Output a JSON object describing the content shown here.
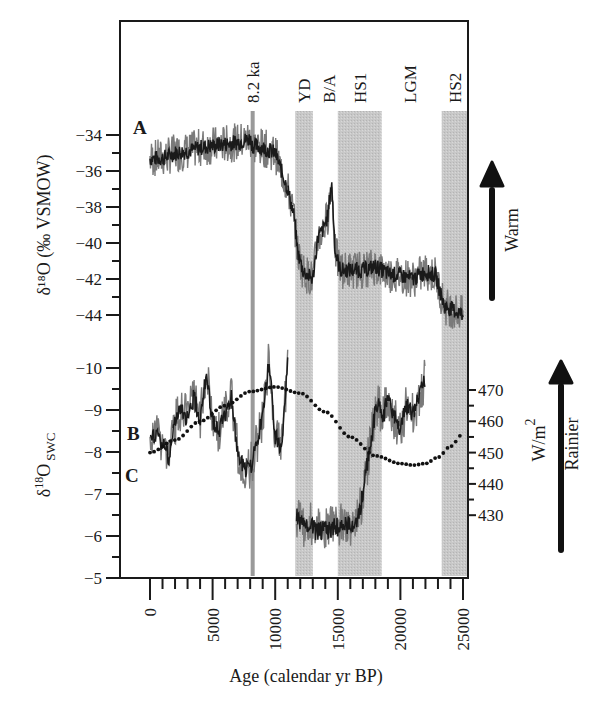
{
  "chart_data": {
    "type": "line",
    "title": "",
    "xlabel": "Age (calendar yr BP)",
    "xlim": [
      0,
      25000
    ],
    "xticks": [
      "0",
      "5000",
      "10000",
      "15000",
      "20000",
      "25000"
    ],
    "events": [
      {
        "label": "8.2 ka",
        "type": "line",
        "age": 8200
      },
      {
        "label": "YD",
        "type": "band",
        "start": 11600,
        "end": 13000
      },
      {
        "label": "B/A",
        "type": "label",
        "age": 14300
      },
      {
        "label": "HS1",
        "type": "band",
        "start": 15000,
        "end": 18500
      },
      {
        "label": "LGM",
        "type": "label",
        "age": 20800
      },
      {
        "label": "HS2",
        "type": "band",
        "start": 23300,
        "end": 25400
      }
    ],
    "panels": [
      {
        "id": "A",
        "ylabel": "δ18O (‰ VSMOW)",
        "ylim": [
          -45,
          -33
        ],
        "yticks": [
          "-34",
          "-36",
          "-38",
          "-40",
          "-42",
          "-44"
        ],
        "annotation_arrow": "Warm",
        "series": [
          {
            "name": "A",
            "style": "noisy-line",
            "x": [
              0,
              1000,
              2000,
              3000,
              4000,
              5000,
              6000,
              7000,
              8000,
              8200,
              9000,
              10000,
              10500,
              11000,
              11500,
              11800,
              12200,
              12600,
              13000,
              13400,
              13800,
              14200,
              14500,
              14800,
              15200,
              16000,
              17000,
              18000,
              19000,
              20000,
              21000,
              22000,
              22800,
              23500,
              24200,
              25000
            ],
            "values": [
              -35.3,
              -35.3,
              -35.0,
              -34.9,
              -34.7,
              -34.6,
              -34.5,
              -34.4,
              -34.2,
              -34.6,
              -34.7,
              -35.0,
              -36.0,
              -37.0,
              -38.5,
              -40.5,
              -41.5,
              -41.8,
              -42.0,
              -39.7,
              -39.3,
              -38.5,
              -36.6,
              -40.5,
              -41.5,
              -41.5,
              -41.5,
              -41.3,
              -41.7,
              -41.8,
              -42.0,
              -41.6,
              -41.8,
              -43.5,
              -43.7,
              -44.0
            ]
          }
        ]
      },
      {
        "id": "B/C",
        "ylabel": "δ18O SWC",
        "ylim": [
          -10.5,
          -5
        ],
        "yticks": [
          "-10",
          "-9",
          "-8",
          "-7",
          "-6",
          "-5"
        ],
        "ylabel_right": "W/m2",
        "yticks_right": [
          "470",
          "460",
          "450",
          "440",
          "430"
        ],
        "ylim_right": [
          425,
          475
        ],
        "annotation_arrow": "Rainier",
        "series": [
          {
            "name": "B",
            "style": "noisy-line",
            "x": [
              0,
              500,
              1000,
              1500,
              2000,
              2500,
              3000,
              3500,
              4000,
              4500,
              5000,
              5500,
              6000,
              6500,
              7000,
              7500,
              8000,
              8500,
              9000,
              9500,
              10000,
              10500,
              11000
            ],
            "values": [
              -8.2,
              -8.5,
              -8.2,
              -7.9,
              -8.7,
              -9.0,
              -8.8,
              -9.3,
              -8.8,
              -9.9,
              -8.7,
              -8.5,
              -8.9,
              -9.3,
              -8.0,
              -7.6,
              -7.6,
              -8.2,
              -8.8,
              -10.2,
              -8.4,
              -8.0,
              -10.2
            ]
          },
          {
            "name": "B (late glacial)",
            "style": "noisy-line",
            "x": [
              11700,
              12000,
              12400,
              12800,
              13200,
              16300,
              16700,
              17000,
              17400,
              17800,
              18200,
              18600,
              19000,
              19500,
              20000,
              20500,
              21000,
              21500,
              22000
            ],
            "values": [
              -6.5,
              -6.3,
              -6.2,
              -6.3,
              -6.1,
              -6.3,
              -6.5,
              -7.0,
              -7.8,
              -8.6,
              -9.2,
              -8.8,
              -9.3,
              -8.8,
              -8.6,
              -9.1,
              -8.9,
              -9.3,
              -9.8
            ]
          },
          {
            "name": "C (insolation W/m2)",
            "style": "dotted",
            "axis": "right",
            "x": [
              0,
              2000,
              4000,
              6000,
              8000,
              10000,
              12000,
              14000,
              16000,
              18000,
              20000,
              21000,
              22000,
              23000,
              24000,
              25000
            ],
            "values": [
              450,
              454,
              460,
              465,
              469.5,
              471,
              469,
              463,
              455,
              449,
              446.5,
              446,
              446.5,
              448.5,
              452,
              456
            ]
          }
        ]
      }
    ]
  },
  "labels": {
    "panel_a": "A",
    "panel_b": "B",
    "panel_c": "C",
    "ylabel_a": "δ¹⁸O (‰ VSMOW)",
    "ylabel_b_main": "δ",
    "ylabel_b_sup": "18",
    "ylabel_b_o": "O",
    "ylabel_b_sub": "SWC",
    "ylabel_right_w": "W/m",
    "ylabel_right_sup": "2",
    "arrow_warm": "Warm",
    "arrow_rainier": "Rainier",
    "xlabel": "Age (calendar yr BP)"
  },
  "colors": {
    "band": "#c8c8c8",
    "event_line": "#9a9a9a",
    "curve_noise": "#7a7a7a",
    "curve_main": "#1a1a1a",
    "axis": "#1a1a1a"
  }
}
